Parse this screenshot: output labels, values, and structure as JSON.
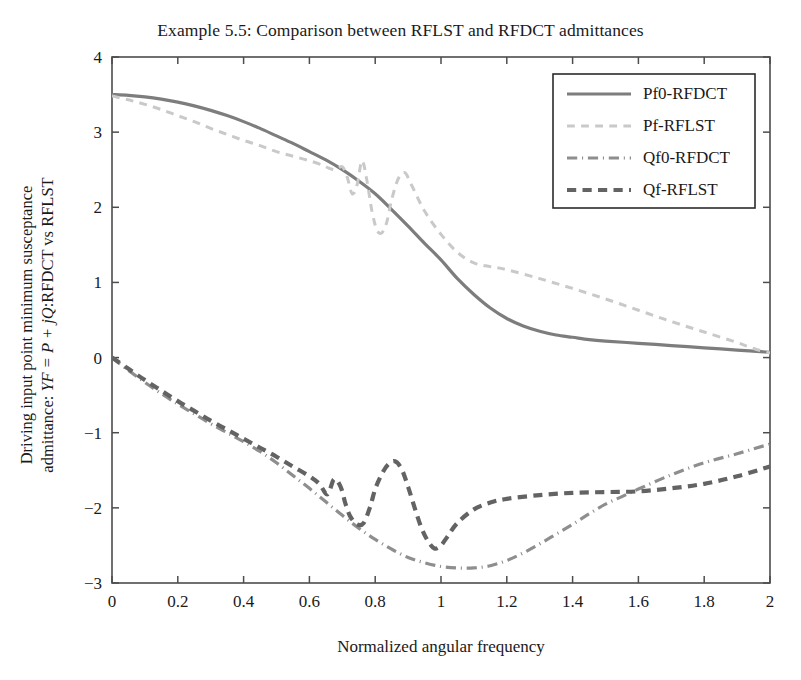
{
  "chart_data": {
    "type": "line",
    "title": "Example 5.5: Comparison between RFLST and RFDCT admittances",
    "xlabel": "Normalized angular frequency",
    "ylabel_line1": "Driving input point minimum susceptance",
    "ylabel_line2_pre": "admittance: ",
    "ylabel_line2_math": "YF = P + jQ",
    "ylabel_line2_post": ":RFDCT vs RFLST",
    "xlim": [
      0,
      2
    ],
    "ylim": [
      -3,
      4
    ],
    "xticks": [
      0,
      0.2,
      0.4,
      0.6,
      0.8,
      1,
      1.2,
      1.4,
      1.6,
      1.8,
      2
    ],
    "xticklabels": [
      "0",
      "0.2",
      "0.4",
      "0.6",
      "0.8",
      "1",
      "1.2",
      "1.4",
      "1.6",
      "1.8",
      "2"
    ],
    "yticks": [
      -3,
      -2,
      -1,
      0,
      1,
      2,
      3,
      4
    ],
    "yticklabels": [
      "−3",
      "−2",
      "−1",
      "0",
      "1",
      "2",
      "3",
      "4"
    ],
    "grid": false,
    "legend_position": "upper right",
    "series": [
      {
        "name": "Pf0-RFDCT",
        "style": "solid",
        "color": "#7d7d7d",
        "width": 3.2,
        "x": [
          0,
          0.05,
          0.1,
          0.15,
          0.2,
          0.25,
          0.3,
          0.35,
          0.4,
          0.45,
          0.5,
          0.55,
          0.6,
          0.65,
          0.7,
          0.75,
          0.8,
          0.85,
          0.9,
          0.95,
          1.0,
          1.05,
          1.1,
          1.15,
          1.2,
          1.25,
          1.3,
          1.35,
          1.4,
          1.45,
          1.5,
          1.6,
          1.7,
          1.8,
          1.9,
          2.0
        ],
        "y": [
          3.5,
          3.49,
          3.47,
          3.44,
          3.4,
          3.35,
          3.29,
          3.22,
          3.14,
          3.05,
          2.95,
          2.85,
          2.74,
          2.63,
          2.5,
          2.35,
          2.18,
          1.97,
          1.75,
          1.52,
          1.3,
          1.05,
          0.84,
          0.66,
          0.52,
          0.42,
          0.35,
          0.3,
          0.27,
          0.24,
          0.22,
          0.19,
          0.16,
          0.13,
          0.1,
          0.07
        ]
      },
      {
        "name": "Pf-RFLST",
        "style": "dashed",
        "color": "#c9c9c9",
        "width": 3.0,
        "x": [
          0,
          0.05,
          0.1,
          0.15,
          0.2,
          0.25,
          0.3,
          0.35,
          0.4,
          0.45,
          0.5,
          0.55,
          0.6,
          0.64,
          0.66,
          0.68,
          0.7,
          0.715,
          0.73,
          0.745,
          0.76,
          0.775,
          0.79,
          0.805,
          0.82,
          0.835,
          0.85,
          0.87,
          0.89,
          0.91,
          0.95,
          1.0,
          1.05,
          1.1,
          1.15,
          1.2,
          1.3,
          1.4,
          1.5,
          1.6,
          1.7,
          1.8,
          1.9,
          1.95,
          2.0
        ],
        "y": [
          3.48,
          3.43,
          3.37,
          3.3,
          3.22,
          3.14,
          3.05,
          2.97,
          2.89,
          2.82,
          2.74,
          2.68,
          2.62,
          2.56,
          2.52,
          2.5,
          2.54,
          2.4,
          2.18,
          2.3,
          2.62,
          2.35,
          1.95,
          1.7,
          1.66,
          1.8,
          2.1,
          2.38,
          2.46,
          2.3,
          1.95,
          1.64,
          1.4,
          1.26,
          1.21,
          1.17,
          1.05,
          0.92,
          0.78,
          0.63,
          0.48,
          0.34,
          0.2,
          0.12,
          0.06
        ]
      },
      {
        "name": "Qf0-RFDCT",
        "style": "dashdot",
        "color": "#8e8e8e",
        "width": 3.2,
        "x": [
          0,
          0.05,
          0.1,
          0.15,
          0.2,
          0.25,
          0.3,
          0.35,
          0.4,
          0.45,
          0.5,
          0.55,
          0.6,
          0.65,
          0.7,
          0.75,
          0.8,
          0.85,
          0.9,
          0.95,
          1.0,
          1.05,
          1.1,
          1.15,
          1.2,
          1.25,
          1.3,
          1.35,
          1.4,
          1.45,
          1.5,
          1.55,
          1.6,
          1.7,
          1.8,
          1.9,
          2.0
        ],
        "y": [
          0.0,
          -0.17,
          -0.33,
          -0.48,
          -0.62,
          -0.75,
          -0.88,
          -1.0,
          -1.12,
          -1.25,
          -1.4,
          -1.57,
          -1.74,
          -1.92,
          -2.1,
          -2.27,
          -2.42,
          -2.55,
          -2.66,
          -2.73,
          -2.78,
          -2.8,
          -2.8,
          -2.77,
          -2.7,
          -2.6,
          -2.48,
          -2.35,
          -2.22,
          -2.08,
          -1.95,
          -1.85,
          -1.75,
          -1.56,
          -1.4,
          -1.28,
          -1.15
        ]
      },
      {
        "name": "Qf-RFLST",
        "style": "dashed-heavy",
        "color": "#636363",
        "width": 4.2,
        "x": [
          0,
          0.05,
          0.1,
          0.15,
          0.2,
          0.25,
          0.3,
          0.35,
          0.4,
          0.45,
          0.5,
          0.55,
          0.6,
          0.63,
          0.655,
          0.675,
          0.695,
          0.71,
          0.725,
          0.745,
          0.765,
          0.785,
          0.8,
          0.82,
          0.84,
          0.86,
          0.88,
          0.9,
          0.92,
          0.94,
          0.96,
          0.98,
          1.0,
          1.02,
          1.05,
          1.1,
          1.15,
          1.2,
          1.3,
          1.4,
          1.5,
          1.6,
          1.7,
          1.8,
          1.9,
          2.0
        ],
        "y": [
          0.0,
          -0.15,
          -0.3,
          -0.44,
          -0.58,
          -0.71,
          -0.84,
          -0.96,
          -1.08,
          -1.2,
          -1.32,
          -1.45,
          -1.58,
          -1.68,
          -1.82,
          -1.62,
          -1.72,
          -1.95,
          -2.12,
          -2.22,
          -2.2,
          -1.98,
          -1.75,
          -1.55,
          -1.42,
          -1.38,
          -1.48,
          -1.72,
          -2.0,
          -2.26,
          -2.44,
          -2.54,
          -2.5,
          -2.38,
          -2.2,
          -2.02,
          -1.93,
          -1.88,
          -1.83,
          -1.8,
          -1.79,
          -1.78,
          -1.74,
          -1.68,
          -1.58,
          -1.45
        ]
      }
    ]
  },
  "axes": {
    "plot_left": 112,
    "plot_right": 770,
    "plot_top": 57,
    "plot_bottom": 583
  },
  "legend": {
    "box": {
      "x": 553,
      "y": 74,
      "width": 202,
      "height": 134
    },
    "entries": [
      {
        "label": "Pf0-RFDCT",
        "style": "solid",
        "color": "#7d7d7d"
      },
      {
        "label": "Pf-RFLST",
        "style": "dashed",
        "color": "#c9c9c9"
      },
      {
        "label": "Qf0-RFDCT",
        "style": "dashdot",
        "color": "#8e8e8e"
      },
      {
        "label": "Qf-RFLST",
        "style": "dashed-heavy",
        "color": "#636363"
      }
    ]
  },
  "colors": {
    "axis": "#4d4d4d",
    "text": "#1a1a1a",
    "background": "#ffffff"
  }
}
